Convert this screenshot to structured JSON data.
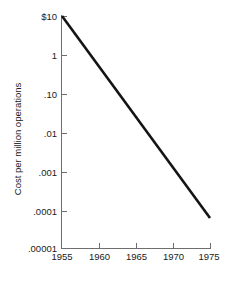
{
  "chart_data": {
    "type": "line",
    "title": "",
    "xlabel": "",
    "ylabel": "Cost per million operations",
    "yscale": "log",
    "xlim": [
      1955,
      1975
    ],
    "ylim": [
      1e-05,
      10
    ],
    "grid": false,
    "legend": null,
    "x_ticks": [
      1955,
      1960,
      1965,
      1970,
      1975
    ],
    "x_tick_labels": [
      "1955",
      "1960",
      "1965",
      "1970",
      "1975"
    ],
    "y_ticks": [
      10,
      1,
      0.1,
      0.01,
      0.001,
      0.0001,
      1e-05
    ],
    "y_tick_labels": [
      "$10",
      "1",
      ".10",
      ".01",
      ".001",
      ".0001",
      ".00001"
    ],
    "series": [
      {
        "name": "Cost per million operations",
        "x": [
          1955,
          1975
        ],
        "values": [
          10,
          6e-05
        ],
        "color": "#141414"
      }
    ]
  },
  "style": {
    "background": "#ffffff",
    "axis_color": "#6e6e6e",
    "text_color": "#1a1a1a",
    "line_color": "#141414"
  }
}
